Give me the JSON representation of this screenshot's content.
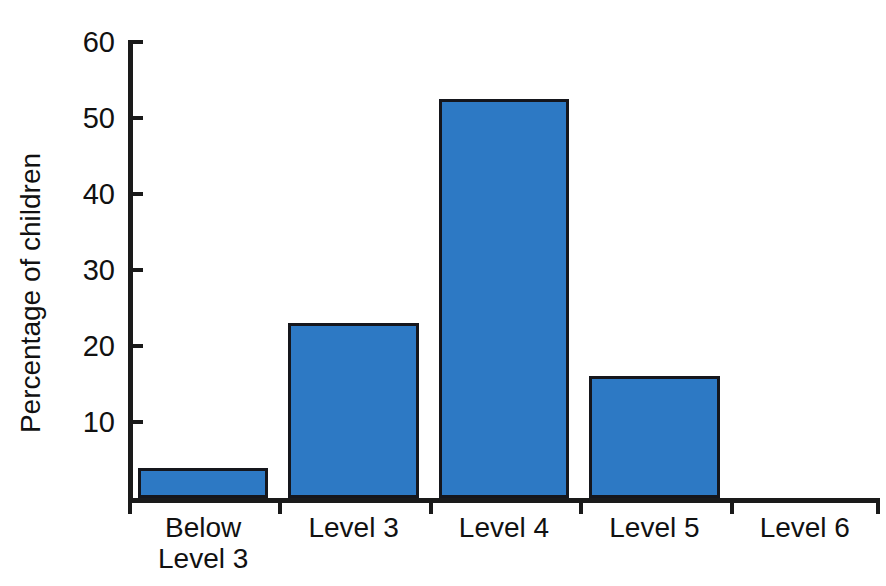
{
  "chart_data": {
    "type": "bar",
    "title": "",
    "subtitle": "",
    "xlabel": "",
    "ylabel": "Percentage of children",
    "categories": [
      "Below\nLevel 3",
      "Level 3",
      "Level 4",
      "Level 5",
      "Level 6"
    ],
    "values": [
      4,
      23,
      52.5,
      16,
      0
    ],
    "ylim": [
      0,
      60
    ],
    "yticks": [
      0,
      10,
      20,
      30,
      40,
      50,
      60
    ],
    "ytick_labels": [
      "",
      "10",
      "20",
      "30",
      "40",
      "50",
      "60"
    ],
    "grid": false,
    "legend": false,
    "legend_position": "none",
    "bar_color": "#2d79c4",
    "bar_edge_color": "#15161c",
    "axis_color": "#1a1a1a",
    "background_color": "#ffffff",
    "annotations": []
  }
}
